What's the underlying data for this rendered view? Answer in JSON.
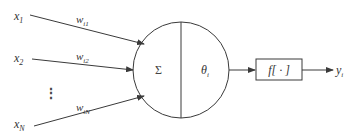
{
  "diagram": {
    "type": "neuron-model",
    "inputs": [
      {
        "label": "x",
        "sub": "1",
        "weight": "w",
        "weight_sub": "i1"
      },
      {
        "label": "x",
        "sub": "2",
        "weight": "w",
        "weight_sub": "i2"
      },
      {
        "label": "x",
        "sub": "N",
        "weight": "w",
        "weight_sub": "iN"
      }
    ],
    "ellipsis": "⋮",
    "neuron": {
      "sum_symbol": "Σ",
      "threshold_label": "θ",
      "threshold_sub": "i"
    },
    "activation": {
      "label": "f[ · ]"
    },
    "output": {
      "label": "y",
      "sub": "i"
    },
    "colors": {
      "stroke": "#3a3a3a",
      "text": "#333333",
      "background": "#ffffff"
    }
  }
}
